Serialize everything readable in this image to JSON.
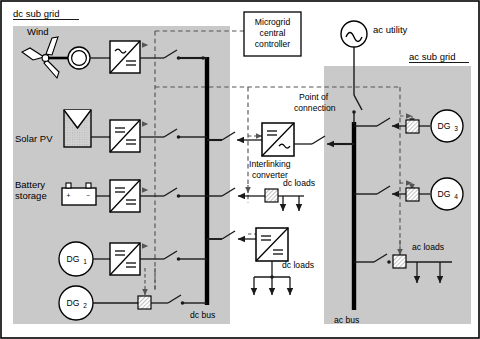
{
  "figure": {
    "colors": {
      "subgrid_fill": "#c9c9c9",
      "outer_border": "#000000",
      "line": "#1a1a1a",
      "bus": "#000000",
      "dashed_control": "#555555",
      "panel_hatch": "#b4b4b4"
    }
  },
  "regions": {
    "dc_sub_grid_label": "dc sub grid",
    "ac_sub_grid_label": "ac sub grid"
  },
  "controller": {
    "line1": "Microgrid",
    "line2": "central",
    "line3": "controller"
  },
  "sources": {
    "wind": "Wind",
    "solar": "Solar PV",
    "battery_line1": "Battery",
    "battery_line2": "storage",
    "dg1": "DG",
    "dg1_sub": "1",
    "dg2": "DG",
    "dg2_sub": "2",
    "dg3": "DG",
    "dg3_sub": "3",
    "dg4": "DG",
    "dg4_sub": "4",
    "ac_utility": "ac utility"
  },
  "buses": {
    "dc_bus": "dc bus",
    "ac_bus": "ac bus"
  },
  "interlinking": {
    "line1": "Interlinking",
    "line2": "converter"
  },
  "point_of_connection": {
    "line1": "Point of",
    "line2": "connection"
  },
  "loads": {
    "dc_loads_upper": "dc loads",
    "dc_loads_lower": "dc loads",
    "ac_loads": "ac loads"
  },
  "converter_symbols": {
    "ac_sine": "∼",
    "dc_equals": "=",
    "battery_plus": "+",
    "battery_minus": "−"
  },
  "counts": {
    "dc_loads_upper_feeders": 2,
    "dc_loads_lower_feeders": 3,
    "ac_loads_feeders": 2
  }
}
